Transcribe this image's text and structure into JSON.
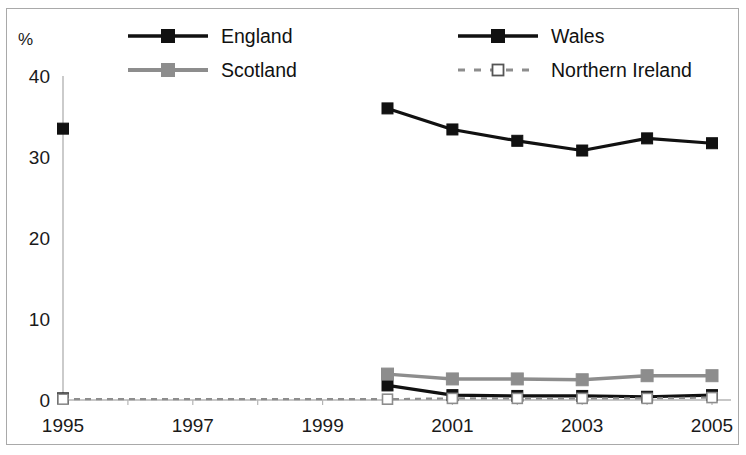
{
  "chart_frame": {
    "border_color": "#a9a9a9",
    "background": "#ffffff"
  },
  "axis": {
    "y_unit_label": "%",
    "y_ticks": [
      "0",
      "10",
      "20",
      "30",
      "40"
    ],
    "y_tick_values": [
      0,
      10,
      20,
      30,
      40
    ],
    "x_ticks": [
      "1995",
      "1997",
      "1999",
      "2001",
      "2003",
      "2005"
    ],
    "x_tick_values": [
      1995,
      1997,
      1999,
      2001,
      2003,
      2005
    ]
  },
  "legend": {
    "entries": [
      {
        "label": "England",
        "color": "#111111",
        "marker": "filled-square",
        "line": "solid"
      },
      {
        "label": "Wales",
        "color": "#111111",
        "marker": "filled-square",
        "line": "solid"
      },
      {
        "label": "Scotland",
        "color": "#8d8d8d",
        "marker": "filled-square",
        "line": "solid"
      },
      {
        "label": "Northern Ireland",
        "color": "#8d8d8d",
        "marker": "open-square",
        "line": "dashed"
      }
    ]
  },
  "chart_data": {
    "type": "line",
    "title": "",
    "subtitle": "",
    "xlabel": "",
    "ylabel": "%",
    "xlim": [
      1995,
      2005
    ],
    "ylim": [
      0,
      40
    ],
    "grid": false,
    "legend_position": "top",
    "x": [
      1995,
      2000,
      2001,
      2002,
      2003,
      2004,
      2005
    ],
    "series": [
      {
        "name": "England",
        "color": "#111111",
        "marker": "filled-square",
        "line": "solid",
        "points": [
          {
            "x": 1995,
            "y": 33.5
          },
          {
            "x": 2000,
            "y": 36.0
          },
          {
            "x": 2001,
            "y": 33.4
          },
          {
            "x": 2002,
            "y": 32.0
          },
          {
            "x": 2003,
            "y": 30.8
          },
          {
            "x": 2004,
            "y": 32.3
          },
          {
            "x": 2005,
            "y": 31.7
          }
        ],
        "gap_between": [
          1995,
          2000
        ]
      },
      {
        "name": "Wales",
        "color": "#111111",
        "marker": "filled-square",
        "line": "solid",
        "points": [
          {
            "x": 1995,
            "y": 0.2
          },
          {
            "x": 2000,
            "y": 1.8
          },
          {
            "x": 2001,
            "y": 0.6
          },
          {
            "x": 2002,
            "y": 0.5
          },
          {
            "x": 2003,
            "y": 0.5
          },
          {
            "x": 2004,
            "y": 0.4
          },
          {
            "x": 2005,
            "y": 0.6
          }
        ],
        "gap_between": [
          1995,
          2000
        ]
      },
      {
        "name": "Scotland",
        "color": "#8d8d8d",
        "marker": "filled-square",
        "line": "solid",
        "points": [
          {
            "x": 2000,
            "y": 3.2
          },
          {
            "x": 2001,
            "y": 2.6
          },
          {
            "x": 2002,
            "y": 2.6
          },
          {
            "x": 2003,
            "y": 2.5
          },
          {
            "x": 2004,
            "y": 3.0
          },
          {
            "x": 2005,
            "y": 3.0
          }
        ]
      },
      {
        "name": "Northern Ireland",
        "color": "#8d8d8d",
        "marker": "open-square",
        "line": "dashed",
        "points": [
          {
            "x": 1995,
            "y": 0.1
          },
          {
            "x": 2000,
            "y": 0.1
          },
          {
            "x": 2001,
            "y": 0.2
          },
          {
            "x": 2002,
            "y": 0.2
          },
          {
            "x": 2003,
            "y": 0.2
          },
          {
            "x": 2004,
            "y": 0.2
          },
          {
            "x": 2005,
            "y": 0.3
          }
        ]
      }
    ]
  }
}
